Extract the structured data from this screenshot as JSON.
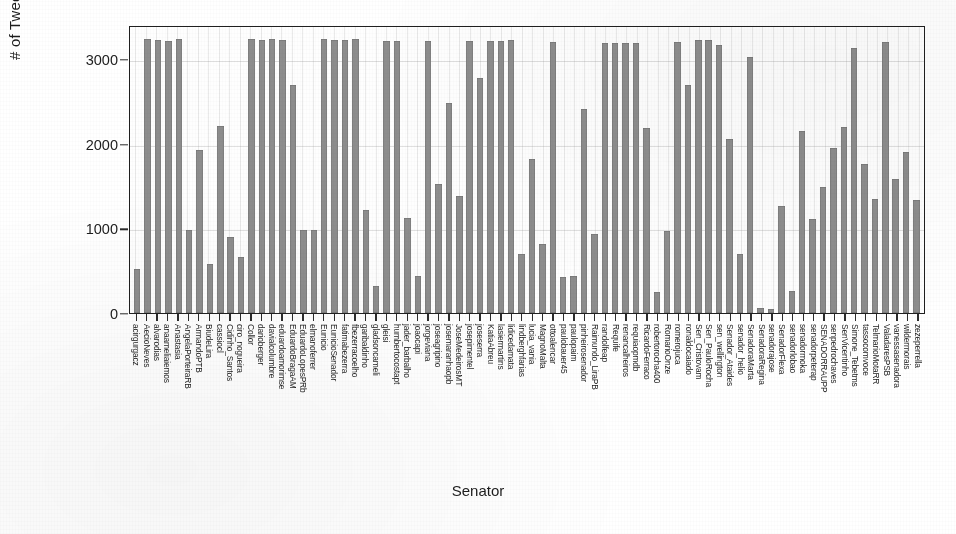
{
  "chart_data": {
    "type": "bar",
    "title": "",
    "xlabel": "Senator",
    "ylabel": "# of Tweets",
    "ylim": [
      0,
      3400
    ],
    "yticks": [
      0,
      1000,
      2000,
      3000
    ],
    "ytick_labels": [
      "0",
      "1000",
      "2000",
      "3000"
    ],
    "grid": true,
    "legend": "none",
    "bar_color": "#8d8d8d",
    "note": "Counts appear capped near 3200 (API retrieval limit) for many senators.",
    "categories": [
      "acirgurgacz",
      "AecioNeves",
      "alvarodias",
      "anaameliaiemos",
      "Anastasia",
      "AngelaPorteiraRB",
      "ArmandoPTB",
      "BiudeLira",
      "cassiocl",
      "Cidinho_Santos",
      "ciro_nogueira",
      "Collor",
      "darioberger",
      "davialcolumbre",
      "eduardoamorimse",
      "EduardoBragaAM",
      "EduardoLopesPRb",
      "elmanoferrer",
      "Eunicio",
      "EunicioSenador",
      "fatimabezerra",
      "fbezerracoelho",
      "garibaldinho",
      "gladsoncameli",
      "gleisi",
      "humbertocostapt",
      "jader_barbalho",
      "joaocapi",
      "jorgeviana",
      "joseagripino",
      "josemaranhaopb",
      "JoseMedeirosMT",
      "josepimentel",
      "joseserra",
      "KatiaAbreu",
      "lasiermartins",
      "lidicedamata",
      "lindberghfarias",
      "lucia_vania",
      "MagnoMalta",
      "ottoalencar",
      "paulobauer45",
      "paulopaim",
      "pinheirosenador",
      "Raimundo_LiraPB",
      "randolfeap",
      "Requife",
      "renancalheiros",
      "requiaopmdb",
      "RicardoFerraco",
      "robertorocha400",
      "RomarioOnze",
      "romerojuca",
      "ronaldocaiado",
      "Sen_Cristovam",
      "Sen_PauloRocha",
      "sen_wellington",
      "Senador_Ataides",
      "senador_helio",
      "SenadoraMarta",
      "SenadoraRegina",
      "senadorajose",
      "SenadorFlexa",
      "senadorlobao",
      "senadormoka",
      "senadorpeterap",
      "SENADORRAUPP",
      "senpedrochaves",
      "SenVicentinho",
      "Simone_Tebetms",
      "tassocomvoce",
      "TelmarioMotaRR",
      "ValadaresPSB",
      "vanessasenadora",
      "wildermorais",
      "zezeperrella"
    ],
    "values": [
      520,
      3230,
      3220,
      3210,
      3230,
      975,
      1930,
      580,
      2210,
      900,
      660,
      3240,
      3225,
      3230,
      3220,
      2690,
      975,
      975,
      3230,
      3220,
      3225,
      3230,
      1215,
      320,
      3215,
      3210,
      1120,
      440,
      3215,
      1520,
      2480,
      1385,
      3215,
      2770,
      3215,
      3215,
      3220,
      700,
      1820,
      820,
      3200,
      420,
      435,
      2410,
      935,
      3190,
      3190,
      3190,
      3190,
      2180,
      245,
      965,
      3200,
      2690,
      3220,
      3220,
      3160,
      2050,
      700,
      3020,
      60,
      45,
      1260,
      255,
      2150,
      1110,
      1490,
      1945,
      2200,
      3130,
      1760,
      1350,
      3200,
      1580,
      1900,
      1340
    ]
  },
  "axis": {
    "y_title": "# of Tweets",
    "x_title": "Senator"
  }
}
